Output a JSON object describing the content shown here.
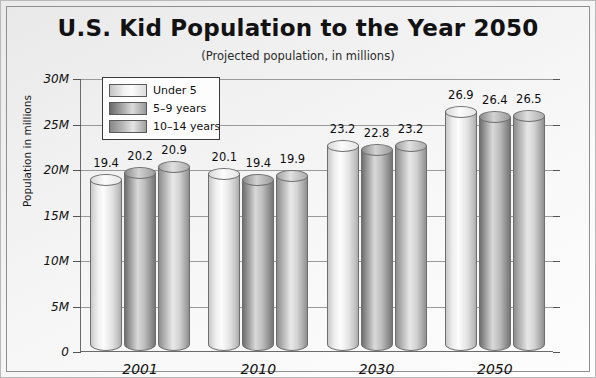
{
  "chart_data": {
    "type": "bar",
    "title": "U.S. Kid Population to the Year 2050",
    "subtitle": "(Projected population, in millions)",
    "xlabel": "",
    "ylabel": "Population in millions",
    "categories": [
      "2001",
      "2010",
      "2030",
      "2050"
    ],
    "ylim": [
      0,
      30
    ],
    "ytick_labels": [
      "0",
      "5M",
      "10M",
      "15M",
      "20M",
      "25M",
      "30M"
    ],
    "ytick_values": [
      0,
      5,
      10,
      15,
      20,
      25,
      30
    ],
    "grid": true,
    "legend_position": "top-left",
    "series": [
      {
        "name": "Under 5",
        "values": [
          19.4,
          20.1,
          23.2,
          26.9
        ]
      },
      {
        "name": "5–9 years",
        "values": [
          20.2,
          19.4,
          22.8,
          26.4
        ]
      },
      {
        "name": "10–14 years",
        "values": [
          20.9,
          19.9,
          23.2,
          26.5
        ]
      }
    ],
    "data_labels": [
      [
        "19.4",
        "20.2",
        "20.9"
      ],
      [
        "20.1",
        "19.4",
        "19.9"
      ],
      [
        "23.2",
        "22.8",
        "23.2"
      ],
      [
        "26.9",
        "26.4",
        "26.5"
      ]
    ]
  },
  "legend": {
    "items": [
      {
        "label": "Under 5"
      },
      {
        "label": "5–9 years"
      },
      {
        "label": "10–14 years"
      }
    ]
  }
}
